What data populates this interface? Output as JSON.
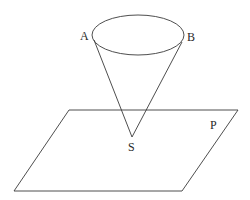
{
  "diagram": {
    "type": "geometry",
    "labels": {
      "A": "A",
      "B": "B",
      "S": "S",
      "P": "P"
    },
    "cone": {
      "base_ellipse": {
        "cx": 138,
        "cy": 35,
        "rx": 46,
        "ry": 20
      },
      "apex": {
        "x": 132,
        "y": 137
      },
      "generator_left_start": {
        "x": 94,
        "y": 40
      },
      "generator_right_start": {
        "x": 182,
        "y": 42
      }
    },
    "plane": {
      "points": [
        [
          69,
          110
        ],
        [
          238,
          110
        ],
        [
          182,
          191
        ],
        [
          14,
          191
        ]
      ]
    },
    "colors": {
      "line": "#3a3a3a",
      "text": "#2a2a2a",
      "background": "#ffffff"
    }
  }
}
